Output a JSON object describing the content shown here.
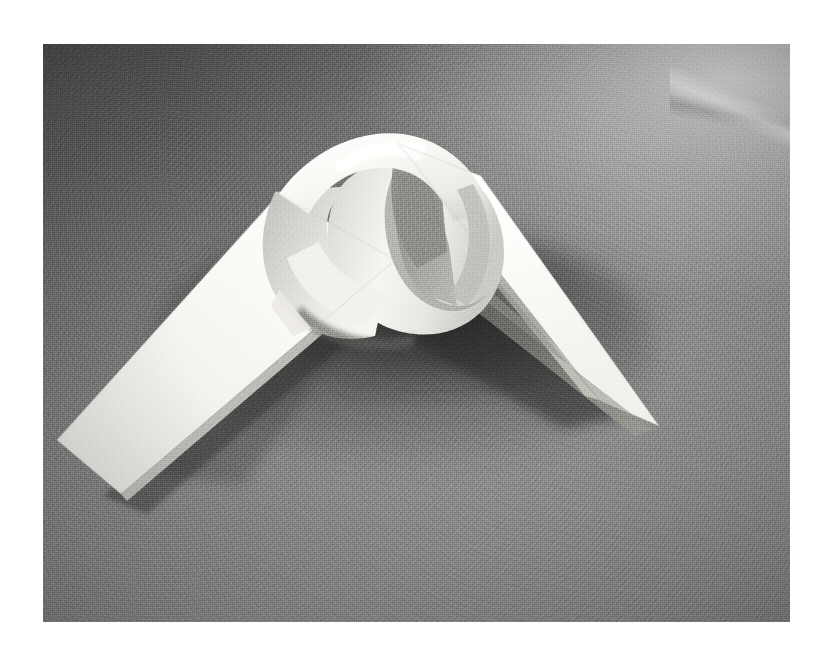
{
  "page": {
    "background_color": "#ffffff",
    "width": 824,
    "height": 661,
    "caption": ""
  },
  "photo": {
    "title": "Paper strip tied in a knot",
    "alt": "Black and white photograph of a flat white paper strip folded and looped into an overhand knot, standing on a textured gray cardboard surface",
    "frame": {
      "left": 43,
      "top": 44,
      "width": 747,
      "height": 578
    },
    "medium": "black-and-white photograph",
    "colors": {
      "paper_highlight": "#fdfdfb",
      "paper_white": "#f4f3ef",
      "paper_midtone": "#d8d7d2",
      "paper_shade": "#bcbbb6",
      "paper_deep_shade": "#9a9a96",
      "loop_interior": "#8f8f8c",
      "cast_shadow": "#3a3a3a",
      "background_dark": "#4e4e4e",
      "background_mid": "#808080",
      "background_light": "#bdbdbd"
    },
    "subject": {
      "object": "paper strip knot",
      "arms": [
        {
          "name": "left-arm",
          "direction": "down-left",
          "tip_x": 115,
          "tip_y": 492
        },
        {
          "name": "right-arm",
          "direction": "down-right",
          "tip_x": 655,
          "tip_y": 425
        }
      ],
      "loop": {
        "center_x": 410,
        "center_y": 245,
        "description": "band curls over itself forming a twisted loop"
      },
      "lighting": "strong light from upper right, deep cast shadow falling down-left"
    }
  }
}
